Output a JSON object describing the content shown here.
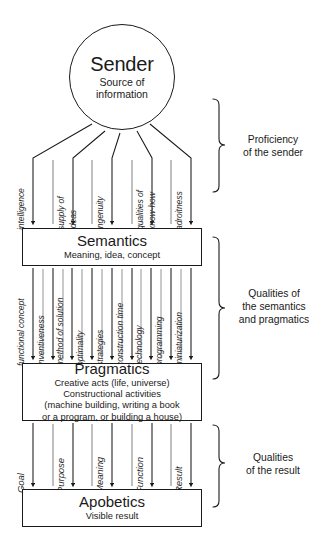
{
  "sender": {
    "title": "Sender",
    "subtitle_line1": "Source of",
    "subtitle_line2": "information"
  },
  "levels": {
    "semantics": {
      "title": "Semantics",
      "subtitle": "Meaning, idea, concept"
    },
    "pragmatics": {
      "title": "Pragmatics",
      "line1": "Creative acts (life, universe)",
      "line2": "Constructional activities",
      "line3": "(machine building, writing a book",
      "line4": "or a program, or building a house)"
    },
    "apobetics": {
      "title": "Apobetics",
      "subtitle": "Visible result"
    }
  },
  "arrow_groups": [
    {
      "name": "sender-to-semantics",
      "labels": [
        "intelligence",
        "supply of",
        "ideas",
        "ingenuity",
        "qualities of",
        "know-how",
        "adroitness"
      ]
    },
    {
      "name": "semantics-to-pragmatics",
      "labels": [
        "functional concept",
        "inventiveness",
        "method of solution",
        "optimality",
        "strategies",
        "construction time",
        "technology",
        "programming",
        "miniaturization"
      ]
    },
    {
      "name": "pragmatics-to-apobetics",
      "labels": [
        "Goal",
        "Purpose",
        "Meaning",
        "Function",
        "Result"
      ]
    }
  ],
  "brackets": [
    {
      "name": "proficiency-of-the-sender",
      "line1": "Proficiency",
      "line2": "of the sender",
      "line3": ""
    },
    {
      "name": "qualities-of-the-semantics-and-pragmatics",
      "line1": "Qualities of",
      "line2": "the semantics",
      "line3": "and pragmatics"
    },
    {
      "name": "qualities-of-the-result",
      "line1": "Qualities",
      "line2": "of the result",
      "line3": ""
    }
  ],
  "colors": {
    "ink": "#1a1a1a",
    "label_ink": "#2b2b2b",
    "background": "#ffffff"
  }
}
